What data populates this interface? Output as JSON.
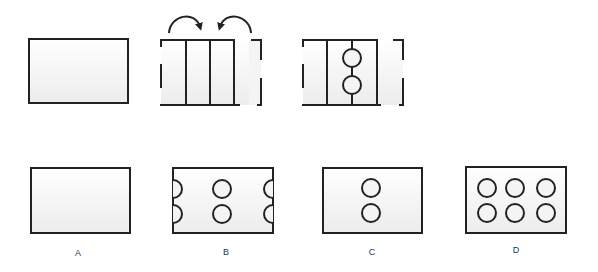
{
  "colors": {
    "stroke": "#222222",
    "fill_top": "#ffffff",
    "fill_bottom": "#ececee",
    "label": "#333333"
  },
  "question": {
    "step1": {
      "description": "Unfolded rectangular sheet of paper"
    },
    "step2": {
      "description": "Sheet folded in thirds/quarters, outer panels folded inward",
      "arrows": [
        "fold-right-arrow",
        "fold-left-arrow"
      ]
    },
    "step3": {
      "description": "Folded sheet with two holes punched through center",
      "holes": 2
    }
  },
  "options": [
    {
      "label": "A",
      "description": "Plain rectangle, no holes",
      "holes": 0
    },
    {
      "label": "B",
      "description": "Two full circles in center, half circles on left and right edges",
      "holes": 2,
      "half_holes": 4
    },
    {
      "label": "C",
      "description": "Two circles stacked vertically in center",
      "holes": 2
    },
    {
      "label": "D",
      "description": "Six circles in two rows of three",
      "holes": 6
    }
  ]
}
